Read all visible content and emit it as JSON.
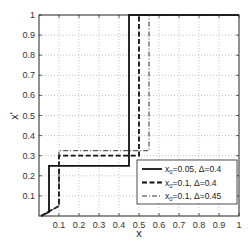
{
  "chart_data": {
    "type": "line",
    "title": "",
    "xlabel": "x",
    "ylabel": "x'",
    "xlim": [
      0,
      1
    ],
    "ylim": [
      0,
      1
    ],
    "grid": true,
    "legend_position": "lower right",
    "xticks": [
      "0.1",
      "0.2",
      "0.3",
      "0.4",
      "0.5",
      "0.6",
      "0.7",
      "0.8",
      "0.9",
      "1"
    ],
    "yticks": [
      "0.1",
      "0.2",
      "0.3",
      "0.4",
      "0.5",
      "0.6",
      "0.7",
      "0.8",
      "0.9",
      "1"
    ],
    "series": [
      {
        "name": "x0=0.05, Δ=0.4",
        "legend_main": "x",
        "legend_sub": "0",
        "legend_rest": "=0.05, Δ=0.4",
        "style": "solid",
        "color": "#111111",
        "x": [
          0.01,
          0.05,
          0.05,
          0.45,
          0.45,
          1.0
        ],
        "y": [
          0.0,
          0.02,
          0.25,
          0.25,
          1.0,
          1.0
        ]
      },
      {
        "name": "x0=0.1, Δ=0.4",
        "legend_main": "x",
        "legend_sub": "0",
        "legend_rest": "=0.1, Δ=0.4",
        "style": "dashed",
        "color": "#111111",
        "x": [
          0.01,
          0.1,
          0.1,
          0.5,
          0.5,
          1.0
        ],
        "y": [
          0.0,
          0.05,
          0.3,
          0.3,
          1.0,
          1.0
        ]
      },
      {
        "name": "x0=0.1, Δ=0.45",
        "legend_main": "x",
        "legend_sub": "0",
        "legend_rest": "=0.1, Δ=0.45",
        "style": "dashdot",
        "color": "#333333",
        "x": [
          0.01,
          0.1,
          0.1,
          0.55,
          0.55,
          1.0
        ],
        "y": [
          0.0,
          0.05,
          0.325,
          0.325,
          1.0,
          1.0
        ]
      }
    ]
  }
}
